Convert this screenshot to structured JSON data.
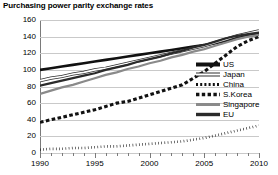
{
  "title": "Purchasing power parity exchange rates",
  "legend": {
    "items": [
      {
        "label": "US",
        "style": "solid-thick",
        "color": "#111111"
      },
      {
        "label": "Japan",
        "style": "double",
        "color": "#333333"
      },
      {
        "label": "China",
        "style": "dotted",
        "color": "#111111"
      },
      {
        "label": "S.Korea",
        "style": "dashed",
        "color": "#111111"
      },
      {
        "label": "Singapore",
        "style": "solid-gray",
        "color": "#8a8a8a"
      },
      {
        "label": "EU",
        "style": "solid-dark",
        "color": "#2b2b2b"
      }
    ]
  },
  "chart_data": {
    "type": "line",
    "title": "Purchasing power parity exchange rates",
    "xlabel": "",
    "ylabel": "",
    "xlim": [
      1990,
      2010
    ],
    "ylim": [
      0,
      160
    ],
    "yticks": [
      0,
      20,
      40,
      60,
      80,
      100,
      120,
      140,
      160
    ],
    "xticks": [
      1990,
      1995,
      2000,
      2005,
      2010
    ],
    "x_minor_step": 1,
    "grid": "horizontal",
    "legend_position": "right-middle",
    "x": [
      1990,
      1991,
      1992,
      1993,
      1994,
      1995,
      1996,
      1997,
      1998,
      1999,
      2000,
      2001,
      2002,
      2003,
      2004,
      2005,
      2006,
      2007,
      2008,
      2009,
      2010
    ],
    "series": [
      {
        "name": "US",
        "style": "solid-thick",
        "color": "#111111",
        "values": [
          100,
          102,
          104,
          106,
          108,
          110,
          112,
          114,
          116,
          118,
          120,
          122,
          124,
          126,
          128,
          130,
          132,
          135,
          138,
          141,
          143
        ]
      },
      {
        "name": "Japan",
        "style": "double",
        "color": "#333333",
        "values": [
          87,
          90,
          92,
          95,
          97,
          100,
          102,
          105,
          108,
          111,
          114,
          117,
          120,
          123,
          126,
          129,
          133,
          137,
          141,
          144,
          147
        ]
      },
      {
        "name": "China",
        "style": "dotted",
        "color": "#111111",
        "values": [
          4,
          5,
          5,
          6,
          6,
          7,
          8,
          8,
          9,
          10,
          11,
          12,
          13,
          14,
          16,
          18,
          21,
          24,
          27,
          30,
          33
        ]
      },
      {
        "name": "S.Korea",
        "style": "dashed",
        "color": "#111111",
        "values": [
          37,
          40,
          43,
          46,
          49,
          52,
          56,
          60,
          62,
          66,
          70,
          74,
          78,
          82,
          90,
          98,
          108,
          118,
          128,
          135,
          140
        ]
      },
      {
        "name": "Singapore",
        "style": "solid-gray",
        "color": "#8a8a8a",
        "values": [
          71,
          75,
          79,
          82,
          86,
          90,
          94,
          97,
          101,
          104,
          108,
          111,
          115,
          118,
          122,
          125,
          129,
          133,
          137,
          140,
          142
        ]
      },
      {
        "name": "EU",
        "style": "solid-dark",
        "color": "#2b2b2b",
        "values": [
          81,
          84,
          87,
          90,
          93,
          96,
          100,
          103,
          106,
          110,
          113,
          116,
          120,
          123,
          127,
          130,
          134,
          138,
          141,
          143,
          145
        ]
      }
    ]
  }
}
